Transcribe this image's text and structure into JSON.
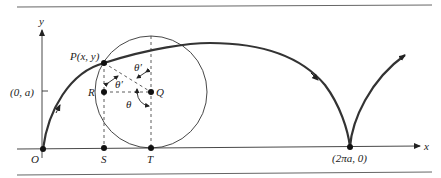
{
  "diagram": {
    "colors": {
      "ink": "#222222",
      "rule": "#555555",
      "background": "#ffffff"
    },
    "axes": {
      "x_label": "x",
      "y_label": "y"
    },
    "points": {
      "origin": "O",
      "P": "P(x, y)",
      "R": "R",
      "Q": "Q",
      "S": "S",
      "T": "T",
      "y_tick": "(0, a)",
      "cusp": "(2πa, 0)"
    },
    "angles": {
      "theta": "θ",
      "theta_prime_upper": "θ′",
      "theta_prime_lower": "θ′"
    }
  }
}
